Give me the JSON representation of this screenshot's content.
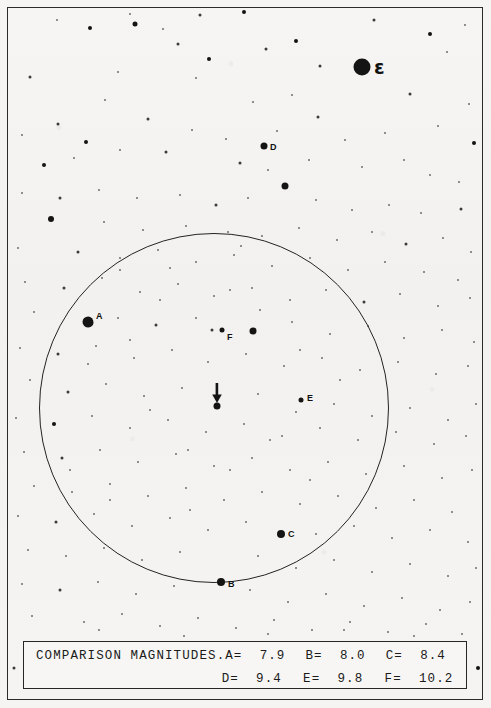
{
  "chart": {
    "kind": "star-finder-chart",
    "background_color": "#f4f3f1",
    "ink_color": "#141414"
  },
  "field_circle": {
    "center_x": 214,
    "center_y": 408,
    "radius": 175,
    "stroke_color": "#232323"
  },
  "target_marker": {
    "type": "down-arrow",
    "x": 217,
    "y": 383,
    "star_x": 217,
    "star_y": 406
  },
  "labeled_stars": [
    {
      "label": "A",
      "x": 88,
      "y": 322,
      "size": 11,
      "label_dx": 8,
      "label_dy": -6,
      "shape": "blob"
    },
    {
      "label": "B",
      "x": 221,
      "y": 582,
      "size": 8,
      "label_dx": 7,
      "label_dy": 2,
      "shape": "round"
    },
    {
      "label": "C",
      "x": 281,
      "y": 534,
      "size": 8,
      "label_dx": 7,
      "label_dy": 0,
      "shape": "round"
    },
    {
      "label": "D",
      "x": 264,
      "y": 146,
      "size": 7,
      "label_dx": 6,
      "label_dy": 1,
      "shape": "round"
    },
    {
      "label": "E",
      "x": 301,
      "y": 400,
      "size": 5,
      "label_dx": 6,
      "label_dy": -2,
      "shape": "round"
    },
    {
      "label": "F",
      "x": 222,
      "y": 330,
      "size": 5,
      "label_dx": 5,
      "label_dy": 7,
      "shape": "round"
    }
  ],
  "greek_star": {
    "label": "ε",
    "x": 362,
    "y": 67,
    "size": 17,
    "label_dx": 12,
    "label_dy": 0
  },
  "legend": {
    "title": "COMPARISON MAGNITUDES.",
    "rows": [
      [
        {
          "name": "A",
          "eq": "A=",
          "value": "7.9"
        },
        {
          "name": "B",
          "eq": "B=",
          "value": "8.0"
        },
        {
          "name": "C",
          "eq": "C=",
          "value": "8.4"
        }
      ],
      [
        {
          "name": "D",
          "eq": "D=",
          "value": "9.4"
        },
        {
          "name": "E",
          "eq": "E=",
          "value": "9.8"
        },
        {
          "name": "F",
          "eq": "F=",
          "value": "10.2"
        }
      ]
    ]
  },
  "starfield": [
    [
      135,
      24,
      5
    ],
    [
      200,
      15,
      3
    ],
    [
      244,
      12,
      4
    ],
    [
      90,
      28,
      4
    ],
    [
      178,
      44,
      3
    ],
    [
      296,
      41,
      4
    ],
    [
      209,
      59,
      4
    ],
    [
      320,
      66,
      3
    ],
    [
      196,
      78,
      2
    ],
    [
      266,
      49,
      3
    ],
    [
      130,
      14,
      2
    ],
    [
      57,
      20,
      2
    ],
    [
      30,
      77,
      3
    ],
    [
      118,
      72,
      2
    ],
    [
      105,
      100,
      2
    ],
    [
      163,
      29,
      2
    ],
    [
      374,
      20,
      3
    ],
    [
      430,
      34,
      4
    ],
    [
      465,
      25,
      2
    ],
    [
      447,
      52,
      2
    ],
    [
      410,
      94,
      3
    ],
    [
      469,
      104,
      2
    ],
    [
      253,
      102,
      2
    ],
    [
      292,
      95,
      2
    ],
    [
      318,
      117,
      3
    ],
    [
      148,
      119,
      3
    ],
    [
      58,
      124,
      3
    ],
    [
      22,
      135,
      2
    ],
    [
      86,
      142,
      4
    ],
    [
      192,
      130,
      2
    ],
    [
      226,
      139,
      2
    ],
    [
      277,
      131,
      2
    ],
    [
      345,
      140,
      2
    ],
    [
      385,
      133,
      2
    ],
    [
      438,
      126,
      2
    ],
    [
      474,
      143,
      4
    ],
    [
      120,
      150,
      2
    ],
    [
      166,
      152,
      3
    ],
    [
      44,
      165,
      4
    ],
    [
      74,
      158,
      2
    ],
    [
      240,
      163,
      3
    ],
    [
      268,
      170,
      2
    ],
    [
      309,
      160,
      2
    ],
    [
      362,
      167,
      2
    ],
    [
      404,
      160,
      2
    ],
    [
      430,
      175,
      2
    ],
    [
      459,
      182,
      2
    ],
    [
      285,
      186,
      7
    ],
    [
      22,
      193,
      2
    ],
    [
      60,
      198,
      3
    ],
    [
      99,
      190,
      2
    ],
    [
      137,
      198,
      2
    ],
    [
      180,
      195,
      2
    ],
    [
      216,
      205,
      3
    ],
    [
      248,
      198,
      2
    ],
    [
      316,
      200,
      2
    ],
    [
      352,
      210,
      2
    ],
    [
      389,
      205,
      2
    ],
    [
      421,
      213,
      2
    ],
    [
      461,
      209,
      3
    ],
    [
      51,
      219,
      6
    ],
    [
      104,
      222,
      2
    ],
    [
      143,
      230,
      2
    ],
    [
      186,
      226,
      2
    ],
    [
      228,
      232,
      2
    ],
    [
      262,
      236,
      2
    ],
    [
      299,
      228,
      2
    ],
    [
      337,
      240,
      2
    ],
    [
      372,
      232,
      2
    ],
    [
      406,
      244,
      3
    ],
    [
      443,
      238,
      2
    ],
    [
      471,
      252,
      2
    ],
    [
      18,
      248,
      2
    ],
    [
      78,
      252,
      3
    ],
    [
      120,
      258,
      2
    ],
    [
      158,
      250,
      2
    ],
    [
      196,
      262,
      2
    ],
    [
      234,
      255,
      2
    ],
    [
      272,
      266,
      2
    ],
    [
      310,
      258,
      2
    ],
    [
      348,
      270,
      2
    ],
    [
      385,
      262,
      2
    ],
    [
      424,
      272,
      2
    ],
    [
      458,
      280,
      2
    ],
    [
      25,
      282,
      2
    ],
    [
      64,
      288,
      3
    ],
    [
      102,
      278,
      2
    ],
    [
      140,
      292,
      2
    ],
    [
      178,
      284,
      2
    ],
    [
      214,
      296,
      2
    ],
    [
      252,
      288,
      2
    ],
    [
      290,
      300,
      2
    ],
    [
      326,
      290,
      2
    ],
    [
      364,
      302,
      3
    ],
    [
      400,
      294,
      2
    ],
    [
      438,
      306,
      2
    ],
    [
      470,
      298,
      2
    ],
    [
      34,
      312,
      2
    ],
    [
      118,
      318,
      2
    ],
    [
      156,
      325,
      3
    ],
    [
      196,
      318,
      2
    ],
    [
      212,
      330,
      3
    ],
    [
      253,
      331,
      7
    ],
    [
      292,
      322,
      2
    ],
    [
      330,
      334,
      2
    ],
    [
      368,
      326,
      2
    ],
    [
      404,
      338,
      2
    ],
    [
      442,
      330,
      2
    ],
    [
      474,
      342,
      2
    ],
    [
      20,
      348,
      2
    ],
    [
      58,
      354,
      3
    ],
    [
      96,
      346,
      2
    ],
    [
      134,
      358,
      2
    ],
    [
      172,
      350,
      2
    ],
    [
      208,
      362,
      2
    ],
    [
      246,
      354,
      2
    ],
    [
      284,
      366,
      2
    ],
    [
      322,
      358,
      2
    ],
    [
      360,
      370,
      2
    ],
    [
      398,
      362,
      2
    ],
    [
      436,
      374,
      2
    ],
    [
      468,
      366,
      2
    ],
    [
      30,
      380,
      2
    ],
    [
      68,
      392,
      3
    ],
    [
      106,
      384,
      2
    ],
    [
      144,
      396,
      2
    ],
    [
      182,
      388,
      2
    ],
    [
      258,
      394,
      2
    ],
    [
      296,
      412,
      2
    ],
    [
      334,
      404,
      2
    ],
    [
      372,
      416,
      2
    ],
    [
      410,
      408,
      2
    ],
    [
      448,
      420,
      2
    ],
    [
      476,
      404,
      2
    ],
    [
      16,
      418,
      2
    ],
    [
      54,
      424,
      4
    ],
    [
      92,
      416,
      2
    ],
    [
      130,
      428,
      2
    ],
    [
      168,
      420,
      2
    ],
    [
      206,
      432,
      2
    ],
    [
      244,
      424,
      2
    ],
    [
      282,
      436,
      2
    ],
    [
      320,
      428,
      2
    ],
    [
      358,
      440,
      2
    ],
    [
      396,
      432,
      2
    ],
    [
      434,
      444,
      2
    ],
    [
      466,
      436,
      2
    ],
    [
      24,
      452,
      2
    ],
    [
      62,
      458,
      3
    ],
    [
      100,
      450,
      2
    ],
    [
      138,
      462,
      2
    ],
    [
      176,
      454,
      2
    ],
    [
      214,
      466,
      2
    ],
    [
      252,
      458,
      2
    ],
    [
      290,
      470,
      2
    ],
    [
      328,
      462,
      2
    ],
    [
      366,
      474,
      2
    ],
    [
      404,
      466,
      2
    ],
    [
      442,
      478,
      2
    ],
    [
      472,
      470,
      2
    ],
    [
      34,
      486,
      2
    ],
    [
      72,
      492,
      2
    ],
    [
      110,
      484,
      2
    ],
    [
      148,
      496,
      2
    ],
    [
      186,
      488,
      2
    ],
    [
      224,
      500,
      2
    ],
    [
      262,
      492,
      2
    ],
    [
      300,
      504,
      2
    ],
    [
      338,
      496,
      2
    ],
    [
      376,
      508,
      2
    ],
    [
      414,
      500,
      2
    ],
    [
      452,
      512,
      2
    ],
    [
      18,
      516,
      2
    ],
    [
      56,
      522,
      3
    ],
    [
      94,
      514,
      2
    ],
    [
      132,
      526,
      2
    ],
    [
      170,
      518,
      2
    ],
    [
      208,
      530,
      2
    ],
    [
      246,
      522,
      2
    ],
    [
      316,
      534,
      2
    ],
    [
      354,
      526,
      2
    ],
    [
      392,
      538,
      2
    ],
    [
      430,
      530,
      2
    ],
    [
      468,
      542,
      2
    ],
    [
      28,
      550,
      2
    ],
    [
      66,
      556,
      2
    ],
    [
      104,
      548,
      2
    ],
    [
      142,
      560,
      2
    ],
    [
      180,
      552,
      2
    ],
    [
      258,
      556,
      2
    ],
    [
      296,
      568,
      2
    ],
    [
      334,
      560,
      2
    ],
    [
      372,
      572,
      2
    ],
    [
      410,
      564,
      2
    ],
    [
      448,
      576,
      2
    ],
    [
      476,
      568,
      2
    ],
    [
      22,
      584,
      2
    ],
    [
      60,
      590,
      3
    ],
    [
      98,
      582,
      2
    ],
    [
      136,
      594,
      2
    ],
    [
      174,
      586,
      2
    ],
    [
      250,
      590,
      2
    ],
    [
      288,
      602,
      2
    ],
    [
      326,
      594,
      2
    ],
    [
      364,
      606,
      2
    ],
    [
      402,
      598,
      2
    ],
    [
      440,
      610,
      2
    ],
    [
      470,
      602,
      2
    ],
    [
      32,
      616,
      2
    ],
    [
      84,
      622,
      2
    ],
    [
      122,
      614,
      2
    ],
    [
      160,
      626,
      2
    ],
    [
      198,
      618,
      2
    ],
    [
      236,
      628,
      2
    ],
    [
      274,
      620,
      2
    ],
    [
      312,
      630,
      2
    ],
    [
      350,
      622,
      2
    ],
    [
      388,
      632,
      2
    ],
    [
      426,
      624,
      2
    ],
    [
      462,
      634,
      2
    ],
    [
      14,
      668,
      3
    ],
    [
      478,
      668,
      4
    ],
    [
      99,
      630,
      2
    ],
    [
      184,
      636,
      2
    ],
    [
      268,
      634,
      2
    ],
    [
      344,
      630,
      2
    ],
    [
      414,
      636,
      2
    ],
    [
      241,
      246,
      2
    ],
    [
      170,
      268,
      2
    ],
    [
      130,
      340,
      2
    ],
    [
      88,
      364,
      2
    ],
    [
      150,
      410,
      2
    ],
    [
      188,
      450,
      2
    ],
    [
      230,
      470,
      2
    ],
    [
      270,
      440,
      2
    ],
    [
      310,
      480,
      2
    ],
    [
      190,
      510,
      2
    ],
    [
      110,
      500,
      2
    ],
    [
      70,
      470,
      2
    ],
    [
      340,
      380,
      2
    ],
    [
      300,
      350,
      2
    ],
    [
      260,
      310,
      2
    ],
    [
      230,
      290,
      2
    ],
    [
      160,
      300,
      2
    ],
    [
      120,
      270,
      2
    ]
  ]
}
